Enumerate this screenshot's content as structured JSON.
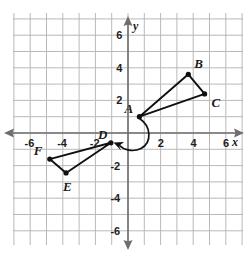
{
  "figure": {
    "type": "coordinate-plane",
    "background_color": "#ffffff",
    "grid_color": "#b9b9b9",
    "axis_color": "#6e6e6e",
    "shape_color": "#101010",
    "axis_names": {
      "x": "x",
      "y": "y"
    }
  },
  "axes": {
    "x_ticks": [
      "-6",
      "-4",
      "-2",
      "2",
      "4",
      "6"
    ],
    "y_ticks": [
      "6",
      "4",
      "2",
      "-2",
      "-4",
      "-6"
    ],
    "x_range": [
      -7,
      7
    ],
    "y_range": [
      -7.3,
      7.3
    ],
    "grid": "on"
  },
  "chart_data": {
    "type": "scatter",
    "title": "",
    "xlabel": "x",
    "ylabel": "y",
    "xlim": [
      -7,
      7
    ],
    "ylim": [
      -7.3,
      7.3
    ],
    "grid": true,
    "legend": "none",
    "series": [
      {
        "name": "Triangle ABC",
        "points": [
          {
            "label": "A",
            "x": 0.7,
            "y": 1.0,
            "label_dx": -15,
            "label_dy": -15
          },
          {
            "label": "B",
            "x": 3.7,
            "y": 3.6,
            "label_dx": 6,
            "label_dy": -17
          },
          {
            "label": "C",
            "x": 4.7,
            "y": 2.4,
            "label_dx": 7,
            "label_dy": 2
          }
        ],
        "closed": true
      },
      {
        "name": "Triangle DEF",
        "points": [
          {
            "label": "D",
            "x": -1.05,
            "y": -0.6,
            "label_dx": -13,
            "label_dy": -15
          },
          {
            "label": "E",
            "x": -3.8,
            "y": -2.45,
            "label_dx": -3,
            "label_dy": 7
          },
          {
            "label": "F",
            "x": -4.8,
            "y": -1.6,
            "label_dx": -16,
            "label_dy": -15
          }
        ],
        "closed": true
      }
    ],
    "annotations": [
      {
        "name": "rotation-arc",
        "type": "curved-arrow",
        "from": "A",
        "to": "D",
        "direction": "clockwise"
      }
    ]
  }
}
